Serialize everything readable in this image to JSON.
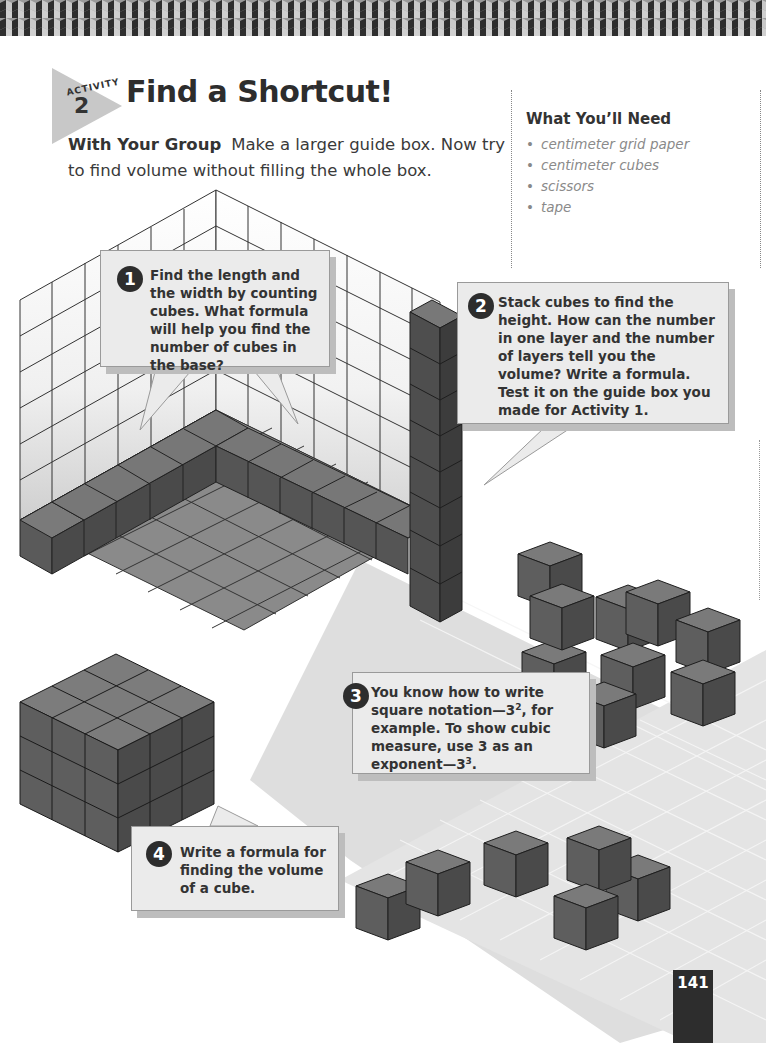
{
  "header": {
    "activity_label": "ACTIVITY",
    "activity_number": "2",
    "title": "Find a Shortcut!"
  },
  "intro": {
    "lead": "With Your Group",
    "text": "Make a larger guide box. Now try to find volume without filling the whole box."
  },
  "materials": {
    "heading": "What You’ll Need",
    "items": [
      "centimeter grid paper",
      "centimeter cubes",
      "scissors",
      "tape"
    ]
  },
  "steps": [
    {
      "number": "1",
      "text": "Find the length and the width by counting cubes. What formula will help you find the number of cubes in the base?"
    },
    {
      "number": "2",
      "text": "Stack cubes to find the height. How can the number in one layer and the number of layers tell you the volume? Write a formula. Test it on the guide box you made for Activity 1."
    },
    {
      "number": "3",
      "text_before": "You know how to write square notation—3",
      "sup1": "2",
      "text_middle": ", for example. To show cubic measure, use 3 as an exponent—3",
      "sup2": "3",
      "text_after": "."
    },
    {
      "number": "4",
      "text": "Write a formula for finding the volume of a cube."
    }
  ],
  "page_number": "141",
  "colors": {
    "cube_top": "#7a7a7a",
    "cube_left": "#5e5e5e",
    "cube_right": "#4a4a4a",
    "callout_bg": "#ebebeb",
    "badge": "#2d2d2d",
    "accent_gray": "#c8c8c8"
  }
}
